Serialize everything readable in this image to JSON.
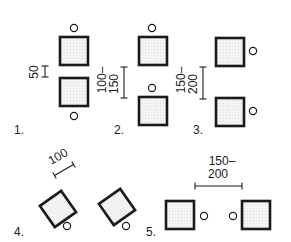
{
  "diagram": {
    "colors": {
      "ink": "#1a1a1a",
      "fill": "#f4f4f4",
      "dots": "#c8c8c8"
    },
    "arrangements": [
      {
        "id": 1,
        "label": "1.",
        "dimension": "50",
        "dimension_line1": "50",
        "description": "Two desks facing each other, chairs on outer sides"
      },
      {
        "id": 2,
        "label": "2.",
        "dimension": "100–150",
        "dimension_line1": "100–",
        "dimension_line2": "150",
        "description": "Two desks in a column, chairs above each"
      },
      {
        "id": 3,
        "label": "3.",
        "dimension": "150–200",
        "dimension_line1": "150–",
        "dimension_line2": "200",
        "description": "Two desks in a column, chairs to the right"
      },
      {
        "id": 4,
        "label": "4.",
        "dimension": "100",
        "dimension_line1": "100",
        "description": "Two desks rotated diagonally, chairs below"
      },
      {
        "id": 5,
        "label": "5.",
        "dimension": "150–200",
        "dimension_line1": "150–",
        "dimension_line2": "200",
        "description": "Two desks side by side, chairs between them"
      }
    ]
  }
}
